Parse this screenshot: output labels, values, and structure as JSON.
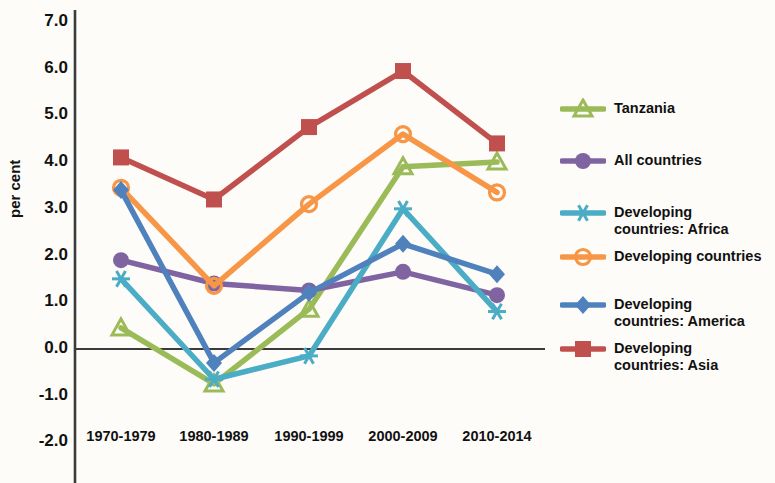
{
  "chart_data": {
    "type": "line",
    "title": "",
    "xlabel": "",
    "ylabel": "per cent",
    "categories": [
      "1970-1979",
      "1980-1989",
      "1990-1999",
      "2000-2009",
      "2010-2014"
    ],
    "ylim": [
      -2.0,
      7.0
    ],
    "yticks": [
      "7.0",
      "6.0",
      "5.0",
      "4.0",
      "3.0",
      "2.0",
      "1.0",
      "0.0",
      "-1.0",
      "-2.0"
    ],
    "ytick_values": [
      7.0,
      6.0,
      5.0,
      4.0,
      3.0,
      2.0,
      1.0,
      0.0,
      -1.0,
      -2.0
    ],
    "grid": false,
    "legend_position": "right",
    "zero_line": 0.0,
    "series": [
      {
        "name": "Tanzania",
        "label": "Tanzania",
        "color": "#9BBB59",
        "marker": "triangle",
        "values": [
          0.45,
          -0.75,
          0.85,
          3.9,
          4.0
        ]
      },
      {
        "name": "All countries",
        "label": "All countries",
        "color": "#8064A2",
        "marker": "circle",
        "values": [
          1.9,
          1.4,
          1.25,
          1.65,
          1.15
        ]
      },
      {
        "name": "Developing countries: Africa",
        "label": "Developing\ncountries: Africa",
        "color": "#4BACC6",
        "marker": "asterisk",
        "values": [
          1.5,
          -0.65,
          -0.15,
          3.0,
          0.8
        ]
      },
      {
        "name": "Developing countries",
        "label": "Developing countries",
        "color": "#F79646",
        "marker": "circle-open",
        "values": [
          3.45,
          1.35,
          3.1,
          4.6,
          3.35
        ]
      },
      {
        "name": "Developing countries: America",
        "label": "Developing\ncountries: America",
        "color": "#4F81BD",
        "marker": "diamond",
        "values": [
          3.4,
          -0.3,
          1.2,
          2.25,
          1.6
        ]
      },
      {
        "name": "Developing countries: Asia",
        "label": "Developing\ncountries: Asia",
        "color": "#C0504D",
        "marker": "square",
        "values": [
          4.1,
          3.2,
          4.75,
          5.95,
          4.4
        ]
      }
    ]
  },
  "axis": {
    "y_title": "per cent"
  }
}
